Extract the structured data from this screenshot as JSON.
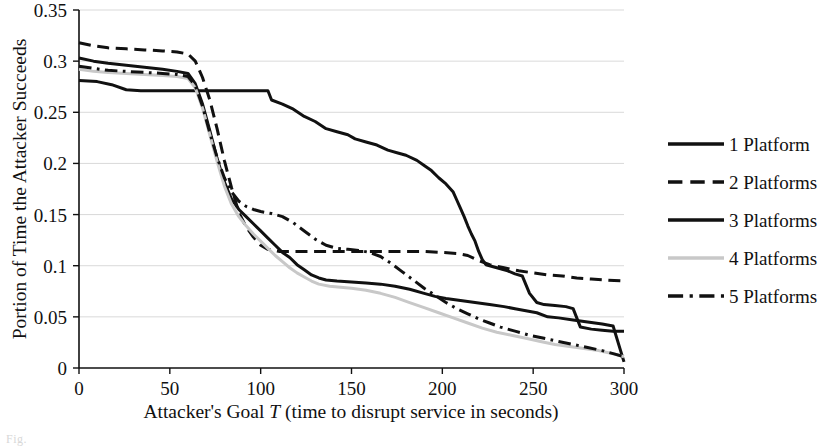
{
  "chart_data": {
    "type": "line",
    "title": "",
    "xlabel": "Attacker's Goal T (time to disrupt service in seconds)",
    "ylabel": "Portion of Time the Attacker Succeeds",
    "xlim": [
      0,
      300
    ],
    "ylim": [
      0,
      0.35
    ],
    "xticks": [
      0,
      50,
      100,
      150,
      200,
      250,
      300
    ],
    "xtick_labels": [
      "0",
      "50",
      "100",
      "150",
      "200",
      "250",
      "300"
    ],
    "yticks": [
      0,
      0.05,
      0.1,
      0.15,
      0.2,
      0.25,
      0.3,
      0.35
    ],
    "ytick_labels": [
      "0",
      "0.05",
      "0.1",
      "0.15",
      "0.2",
      "0.25",
      "0.3",
      "0.35"
    ],
    "grid": true,
    "grid_color": "#cfcfcf",
    "legend_position": "right",
    "series": [
      {
        "name": "1 Platform",
        "style": "solid",
        "color": "#111111",
        "width": 3.0,
        "points": [
          [
            0,
            0.281
          ],
          [
            10,
            0.28
          ],
          [
            18,
            0.277
          ],
          [
            26,
            0.272
          ],
          [
            34,
            0.271
          ],
          [
            44,
            0.271
          ],
          [
            52,
            0.271
          ],
          [
            60,
            0.271
          ],
          [
            70,
            0.271
          ],
          [
            80,
            0.271
          ],
          [
            90,
            0.271
          ],
          [
            100,
            0.271
          ],
          [
            104,
            0.271
          ],
          [
            106,
            0.262
          ],
          [
            112,
            0.258
          ],
          [
            118,
            0.253
          ],
          [
            124,
            0.246
          ],
          [
            130,
            0.241
          ],
          [
            136,
            0.234
          ],
          [
            142,
            0.231
          ],
          [
            148,
            0.228
          ],
          [
            152,
            0.224
          ],
          [
            158,
            0.221
          ],
          [
            164,
            0.218
          ],
          [
            170,
            0.213
          ],
          [
            176,
            0.21
          ],
          [
            180,
            0.208
          ],
          [
            186,
            0.203
          ],
          [
            190,
            0.198
          ],
          [
            194,
            0.193
          ],
          [
            198,
            0.186
          ],
          [
            202,
            0.18
          ],
          [
            206,
            0.172
          ],
          [
            208,
            0.164
          ],
          [
            210,
            0.156
          ],
          [
            212,
            0.148
          ],
          [
            214,
            0.139
          ],
          [
            216,
            0.131
          ],
          [
            218,
            0.124
          ],
          [
            220,
            0.114
          ],
          [
            222,
            0.106
          ],
          [
            224,
            0.101
          ],
          [
            230,
            0.098
          ],
          [
            236,
            0.095
          ],
          [
            240,
            0.092
          ],
          [
            244,
            0.09
          ],
          [
            248,
            0.073
          ],
          [
            252,
            0.064
          ],
          [
            256,
            0.062
          ],
          [
            262,
            0.061
          ],
          [
            268,
            0.06
          ],
          [
            272,
            0.058
          ],
          [
            276,
            0.04
          ],
          [
            282,
            0.038
          ],
          [
            288,
            0.037
          ],
          [
            294,
            0.036
          ],
          [
            300,
            0.036
          ]
        ]
      },
      {
        "name": "2 Platforms",
        "style": "dashed",
        "color": "#111111",
        "width": 3.0,
        "points": [
          [
            0,
            0.318
          ],
          [
            8,
            0.315
          ],
          [
            16,
            0.313
          ],
          [
            26,
            0.312
          ],
          [
            36,
            0.311
          ],
          [
            46,
            0.31
          ],
          [
            54,
            0.309
          ],
          [
            60,
            0.307
          ],
          [
            64,
            0.3
          ],
          [
            68,
            0.284
          ],
          [
            72,
            0.262
          ],
          [
            76,
            0.234
          ],
          [
            80,
            0.203
          ],
          [
            84,
            0.176
          ],
          [
            88,
            0.152
          ],
          [
            92,
            0.138
          ],
          [
            96,
            0.128
          ],
          [
            100,
            0.12
          ],
          [
            104,
            0.116
          ],
          [
            110,
            0.114
          ],
          [
            120,
            0.114
          ],
          [
            130,
            0.114
          ],
          [
            140,
            0.114
          ],
          [
            150,
            0.114
          ],
          [
            160,
            0.114
          ],
          [
            170,
            0.114
          ],
          [
            180,
            0.114
          ],
          [
            190,
            0.114
          ],
          [
            200,
            0.113
          ],
          [
            208,
            0.112
          ],
          [
            214,
            0.11
          ],
          [
            220,
            0.105
          ],
          [
            226,
            0.101
          ],
          [
            234,
            0.098
          ],
          [
            242,
            0.095
          ],
          [
            250,
            0.093
          ],
          [
            258,
            0.091
          ],
          [
            266,
            0.09
          ],
          [
            274,
            0.088
          ],
          [
            282,
            0.087
          ],
          [
            290,
            0.086
          ],
          [
            300,
            0.085
          ]
        ]
      },
      {
        "name": "3 Platforms",
        "style": "solid",
        "color": "#111111",
        "width": 3.0,
        "points": [
          [
            0,
            0.303
          ],
          [
            8,
            0.3
          ],
          [
            16,
            0.298
          ],
          [
            26,
            0.296
          ],
          [
            36,
            0.294
          ],
          [
            46,
            0.292
          ],
          [
            54,
            0.29
          ],
          [
            60,
            0.288
          ],
          [
            64,
            0.278
          ],
          [
            68,
            0.258
          ],
          [
            72,
            0.232
          ],
          [
            76,
            0.205
          ],
          [
            80,
            0.182
          ],
          [
            84,
            0.165
          ],
          [
            88,
            0.155
          ],
          [
            92,
            0.148
          ],
          [
            96,
            0.141
          ],
          [
            100,
            0.134
          ],
          [
            104,
            0.127
          ],
          [
            108,
            0.12
          ],
          [
            112,
            0.113
          ],
          [
            116,
            0.108
          ],
          [
            120,
            0.101
          ],
          [
            124,
            0.096
          ],
          [
            128,
            0.091
          ],
          [
            132,
            0.088
          ],
          [
            136,
            0.086
          ],
          [
            142,
            0.085
          ],
          [
            150,
            0.084
          ],
          [
            158,
            0.083
          ],
          [
            166,
            0.082
          ],
          [
            174,
            0.08
          ],
          [
            182,
            0.077
          ],
          [
            190,
            0.073
          ],
          [
            196,
            0.07
          ],
          [
            202,
            0.068
          ],
          [
            210,
            0.066
          ],
          [
            218,
            0.064
          ],
          [
            226,
            0.062
          ],
          [
            234,
            0.06
          ],
          [
            240,
            0.058
          ],
          [
            246,
            0.056
          ],
          [
            252,
            0.054
          ],
          [
            258,
            0.05
          ],
          [
            264,
            0.049
          ],
          [
            272,
            0.047
          ],
          [
            280,
            0.045
          ],
          [
            288,
            0.043
          ],
          [
            294,
            0.041
          ],
          [
            300,
            0.006
          ]
        ]
      },
      {
        "name": "4 Platforms",
        "style": "solid",
        "color": "#c8c8c8",
        "width": 3.0,
        "points": [
          [
            0,
            0.292
          ],
          [
            8,
            0.29
          ],
          [
            16,
            0.289
          ],
          [
            26,
            0.288
          ],
          [
            36,
            0.287
          ],
          [
            46,
            0.286
          ],
          [
            54,
            0.285
          ],
          [
            60,
            0.283
          ],
          [
            64,
            0.274
          ],
          [
            68,
            0.254
          ],
          [
            72,
            0.228
          ],
          [
            76,
            0.202
          ],
          [
            80,
            0.178
          ],
          [
            84,
            0.16
          ],
          [
            88,
            0.148
          ],
          [
            92,
            0.139
          ],
          [
            96,
            0.131
          ],
          [
            100,
            0.124
          ],
          [
            104,
            0.117
          ],
          [
            108,
            0.11
          ],
          [
            112,
            0.104
          ],
          [
            116,
            0.098
          ],
          [
            120,
            0.093
          ],
          [
            124,
            0.089
          ],
          [
            128,
            0.085
          ],
          [
            132,
            0.082
          ],
          [
            138,
            0.08
          ],
          [
            144,
            0.079
          ],
          [
            150,
            0.078
          ],
          [
            158,
            0.076
          ],
          [
            166,
            0.073
          ],
          [
            174,
            0.069
          ],
          [
            182,
            0.064
          ],
          [
            190,
            0.059
          ],
          [
            198,
            0.054
          ],
          [
            206,
            0.049
          ],
          [
            214,
            0.044
          ],
          [
            222,
            0.039
          ],
          [
            230,
            0.035
          ],
          [
            238,
            0.032
          ],
          [
            246,
            0.029
          ],
          [
            254,
            0.026
          ],
          [
            262,
            0.023
          ],
          [
            270,
            0.021
          ],
          [
            278,
            0.019
          ],
          [
            286,
            0.017
          ],
          [
            294,
            0.014
          ],
          [
            300,
            0.011
          ]
        ]
      },
      {
        "name": "5 Platforms",
        "style": "dashdot",
        "color": "#111111",
        "width": 3.0,
        "points": [
          [
            0,
            0.295
          ],
          [
            8,
            0.293
          ],
          [
            16,
            0.291
          ],
          [
            26,
            0.29
          ],
          [
            36,
            0.289
          ],
          [
            46,
            0.288
          ],
          [
            54,
            0.287
          ],
          [
            60,
            0.285
          ],
          [
            64,
            0.276
          ],
          [
            68,
            0.256
          ],
          [
            72,
            0.23
          ],
          [
            76,
            0.206
          ],
          [
            80,
            0.186
          ],
          [
            84,
            0.172
          ],
          [
            88,
            0.163
          ],
          [
            92,
            0.158
          ],
          [
            96,
            0.155
          ],
          [
            100,
            0.153
          ],
          [
            106,
            0.151
          ],
          [
            112,
            0.148
          ],
          [
            118,
            0.142
          ],
          [
            124,
            0.134
          ],
          [
            130,
            0.126
          ],
          [
            136,
            0.12
          ],
          [
            142,
            0.117
          ],
          [
            148,
            0.116
          ],
          [
            154,
            0.115
          ],
          [
            160,
            0.113
          ],
          [
            166,
            0.109
          ],
          [
            172,
            0.102
          ],
          [
            178,
            0.094
          ],
          [
            184,
            0.086
          ],
          [
            190,
            0.078
          ],
          [
            196,
            0.071
          ],
          [
            202,
            0.064
          ],
          [
            208,
            0.058
          ],
          [
            214,
            0.053
          ],
          [
            220,
            0.048
          ],
          [
            226,
            0.044
          ],
          [
            232,
            0.04
          ],
          [
            240,
            0.036
          ],
          [
            248,
            0.032
          ],
          [
            256,
            0.029
          ],
          [
            264,
            0.026
          ],
          [
            272,
            0.023
          ],
          [
            280,
            0.02
          ],
          [
            288,
            0.017
          ],
          [
            294,
            0.014
          ],
          [
            300,
            0.011
          ]
        ]
      }
    ]
  },
  "legend": {
    "items": [
      {
        "label": "1 Platform",
        "style": "solid",
        "color": "#111111"
      },
      {
        "label": "2 Platforms",
        "style": "dashed",
        "color": "#111111"
      },
      {
        "label": "3 Platforms",
        "style": "solid",
        "color": "#111111"
      },
      {
        "label": "4 Platforms",
        "style": "solid",
        "color": "#c8c8c8"
      },
      {
        "label": "5 Platforms",
        "style": "dashdot",
        "color": "#111111"
      }
    ]
  },
  "axis": {
    "y_title": "Portion of Time the Attacker Succeeds",
    "x_title_prefix": "Attacker's Goal ",
    "x_title_italic": "T",
    "x_title_suffix": " (time to disrupt service in seconds)"
  }
}
